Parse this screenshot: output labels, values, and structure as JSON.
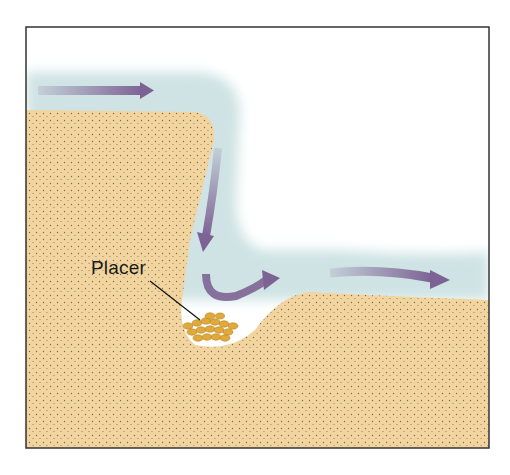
{
  "diagram": {
    "type": "cross-section",
    "labels": {
      "placer": "Placer"
    },
    "elements": [
      {
        "name": "upstream-flow-arrow",
        "direction": "right"
      },
      {
        "name": "plunge-flow-arrow",
        "direction": "down"
      },
      {
        "name": "eddy-flow-arrow",
        "direction": "curving up-right"
      },
      {
        "name": "downstream-flow-arrow",
        "direction": "right"
      },
      {
        "name": "placer-deposit",
        "description": "gold-colored grains in channel depression"
      }
    ]
  },
  "colors": {
    "sediment": "#f2d49e",
    "sediment_dots": "#7a6a55",
    "water": "#cfe3e4",
    "arrow": "#7d6394",
    "placer": "#e0a93a",
    "frame": "#333333"
  }
}
